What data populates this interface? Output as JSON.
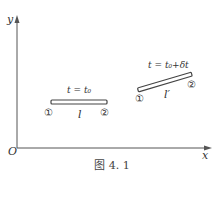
{
  "axes": {
    "y_label": "y",
    "x_label": "x",
    "origin_label": "O"
  },
  "rod_initial": {
    "time_label": "t = t₀",
    "length_label": "l",
    "end1_label": "①",
    "end2_label": "②"
  },
  "rod_later": {
    "time_label": "t = t₀+δt",
    "length_label": "l′",
    "end1_label": "①",
    "end2_label": "②"
  },
  "caption": "图 4. 1",
  "colors": {
    "axis": "#555555",
    "rod_outline": "#444444",
    "rod_fill": "#ffffff",
    "text": "#333333"
  }
}
